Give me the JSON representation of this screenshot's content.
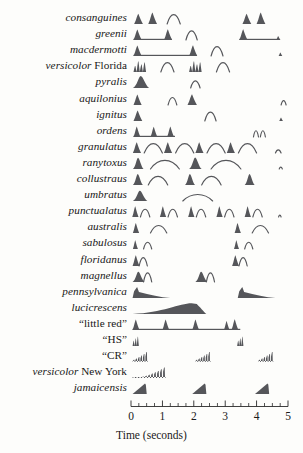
{
  "figure": {
    "axis": {
      "label": "Time (seconds)",
      "ticks": [
        "0",
        "1",
        "2",
        "3",
        "4",
        "5"
      ],
      "min": 0,
      "max": 5,
      "unit": "seconds",
      "x_pixel_start": 131,
      "x_pixel_end": 288
    },
    "colors": {
      "flash_fill": "#55565a",
      "response_stroke": "#55565a",
      "axis": "#2b2b2b",
      "text": "#171717",
      "background": "#fdfdfb"
    },
    "legend_note": "Filled shapes = male flash pattern; thin outline arcs = female response flash"
  },
  "chart_data": {
    "type": "timeline",
    "xlabel": "Time (seconds)",
    "ylabel": "",
    "xlim": [
      0,
      5
    ],
    "grid": false,
    "legend": [
      "male flash (filled)",
      "female response (outline)"
    ],
    "categories": [
      "consanguines",
      "greenii",
      "macdermotti",
      "versicolor Florida",
      "pyralis",
      "aquilonius",
      "ignitus",
      "ordens",
      "granulatus",
      "ranytoxus",
      "collustraus",
      "umbratus",
      "punctualatus",
      "australis",
      "sabulosus",
      "floridanus",
      "magnellus",
      "pennsylvanica",
      "lucicrescens",
      "“little red”",
      "“HS”",
      "“CR”",
      "versicolor New York",
      "jamaicensis"
    ],
    "rows": [
      {
        "species": "consanguines",
        "label_italic": "consanguines",
        "label_roman": "",
        "flashes": [
          {
            "t": 0.1,
            "dur": 0.28,
            "h": 0.78,
            "shape": "peak"
          },
          {
            "t": 0.55,
            "dur": 0.28,
            "h": 0.88,
            "shape": "peak"
          },
          {
            "t": 3.55,
            "dur": 0.28,
            "h": 0.78,
            "shape": "peak"
          },
          {
            "t": 4.0,
            "dur": 0.28,
            "h": 0.88,
            "shape": "peak"
          }
        ],
        "responses": [
          {
            "t": 1.15,
            "dur": 0.42,
            "h": 0.72,
            "shape": "arc"
          }
        ],
        "baselines": []
      },
      {
        "species": "greenii",
        "label_italic": "greenii",
        "label_roman": "",
        "flashes": [
          {
            "t": 0.08,
            "dur": 0.26,
            "h": 0.8,
            "shape": "peak"
          },
          {
            "t": 1.05,
            "dur": 0.26,
            "h": 0.82,
            "shape": "peak"
          },
          {
            "t": 3.45,
            "dur": 0.26,
            "h": 0.82,
            "shape": "peak"
          },
          {
            "t": 4.62,
            "dur": 0.14,
            "h": 0.3,
            "shape": "peak"
          }
        ],
        "responses": [
          {
            "t": 1.75,
            "dur": 0.36,
            "h": 0.7,
            "shape": "arc"
          }
        ],
        "baselines": [
          {
            "t0": 0.08,
            "t1": 1.3
          },
          {
            "t0": 3.45,
            "t1": 4.7
          }
        ]
      },
      {
        "species": "macdermotti",
        "label_italic": "macdermotti",
        "label_roman": "",
        "flashes": [
          {
            "t": 0.08,
            "dur": 0.26,
            "h": 0.8,
            "shape": "peak"
          },
          {
            "t": 1.85,
            "dur": 0.26,
            "h": 0.82,
            "shape": "peak"
          },
          {
            "t": 4.7,
            "dur": 0.12,
            "h": 0.26,
            "shape": "peak"
          }
        ],
        "responses": [
          {
            "t": 2.55,
            "dur": 0.38,
            "h": 0.72,
            "shape": "arc"
          }
        ],
        "baselines": [
          {
            "t0": 0.08,
            "t1": 2.1
          }
        ]
      },
      {
        "species": "versicolor Florida",
        "label_italic": "versicolor",
        "label_roman": " Florida",
        "flashes": [
          {
            "t": 0.08,
            "dur": 0.4,
            "h": 0.8,
            "shape": "comb4"
          },
          {
            "t": 1.85,
            "dur": 0.4,
            "h": 0.8,
            "shape": "comb4"
          }
        ],
        "responses": [
          {
            "t": 0.95,
            "dur": 0.42,
            "h": 0.72,
            "shape": "arc"
          },
          {
            "t": 2.72,
            "dur": 0.42,
            "h": 0.72,
            "shape": "arc"
          }
        ],
        "baselines": []
      },
      {
        "species": "pyralis",
        "label_italic": "pyralis",
        "label_roman": "",
        "flashes": [
          {
            "t": 0.06,
            "dur": 0.52,
            "h": 0.92,
            "shape": "bell"
          }
        ],
        "responses": [
          {
            "t": 1.9,
            "dur": 0.3,
            "h": 0.55,
            "shape": "arc"
          }
        ],
        "baselines": []
      },
      {
        "species": "aquilonius",
        "label_italic": "aquilonius",
        "label_roman": "",
        "flashes": [
          {
            "t": 0.08,
            "dur": 0.26,
            "h": 0.8,
            "shape": "peak"
          },
          {
            "t": 1.8,
            "dur": 0.3,
            "h": 0.82,
            "shape": "peak"
          }
        ],
        "responses": [
          {
            "t": 1.18,
            "dur": 0.28,
            "h": 0.58,
            "shape": "arc"
          },
          {
            "t": 4.78,
            "dur": 0.16,
            "h": 0.34,
            "shape": "arc"
          }
        ],
        "baselines": []
      },
      {
        "species": "ignitus",
        "label_italic": "ignitus",
        "label_roman": "",
        "flashes": [
          {
            "t": 0.08,
            "dur": 0.28,
            "h": 0.8,
            "shape": "peak"
          },
          {
            "t": 4.72,
            "dur": 0.12,
            "h": 0.26,
            "shape": "peak"
          }
        ],
        "responses": [
          {
            "t": 2.35,
            "dur": 0.36,
            "h": 0.68,
            "shape": "arc"
          }
        ],
        "baselines": []
      },
      {
        "species": "ordens",
        "label_italic": "ordens",
        "label_roman": "",
        "flashes": [
          {
            "t": 0.08,
            "dur": 0.22,
            "h": 0.8,
            "shape": "peak"
          },
          {
            "t": 0.62,
            "dur": 0.22,
            "h": 0.78,
            "shape": "peak"
          },
          {
            "t": 1.15,
            "dur": 0.22,
            "h": 0.8,
            "shape": "peak"
          }
        ],
        "responses": [
          {
            "t": 3.9,
            "dur": 0.16,
            "h": 0.48,
            "shape": "arc"
          },
          {
            "t": 4.12,
            "dur": 0.16,
            "h": 0.48,
            "shape": "arc"
          }
        ],
        "baselines": [
          {
            "t0": 0.08,
            "t1": 1.4
          }
        ]
      },
      {
        "species": "granulatus",
        "label_italic": "granulatus",
        "label_roman": "",
        "flashes": [
          {
            "t": 0.06,
            "dur": 0.26,
            "h": 0.82,
            "shape": "peak"
          },
          {
            "t": 1.05,
            "dur": 0.26,
            "h": 0.82,
            "shape": "peak"
          },
          {
            "t": 2.05,
            "dur": 0.26,
            "h": 0.82,
            "shape": "peak"
          },
          {
            "t": 3.05,
            "dur": 0.26,
            "h": 0.82,
            "shape": "peak"
          }
        ],
        "responses": [
          {
            "t": 0.42,
            "dur": 0.58,
            "h": 0.72,
            "shape": "arc"
          },
          {
            "t": 1.42,
            "dur": 0.58,
            "h": 0.72,
            "shape": "arc"
          },
          {
            "t": 2.42,
            "dur": 0.58,
            "h": 0.72,
            "shape": "arc"
          },
          {
            "t": 3.42,
            "dur": 0.58,
            "h": 0.72,
            "shape": "arc"
          },
          {
            "t": 4.6,
            "dur": 0.18,
            "h": 0.24,
            "shape": "arc"
          }
        ],
        "baselines": []
      },
      {
        "species": "ranytoxus",
        "label_italic": "ranytoxus",
        "label_roman": "",
        "flashes": [
          {
            "t": 0.06,
            "dur": 0.34,
            "h": 0.86,
            "shape": "bell"
          },
          {
            "t": 1.85,
            "dur": 0.4,
            "h": 0.88,
            "shape": "bell"
          }
        ],
        "responses": [
          {
            "t": 0.62,
            "dur": 0.92,
            "h": 0.66,
            "shape": "arc"
          },
          {
            "t": 2.55,
            "dur": 0.95,
            "h": 0.66,
            "shape": "arc"
          },
          {
            "t": 4.72,
            "dur": 0.1,
            "h": 0.14,
            "shape": "arc"
          }
        ],
        "baselines": []
      },
      {
        "species": "collustraus",
        "label_italic": "collustraus",
        "label_roman": "",
        "flashes": [
          {
            "t": 0.06,
            "dur": 0.32,
            "h": 0.84,
            "shape": "bell"
          },
          {
            "t": 1.72,
            "dur": 0.32,
            "h": 0.84,
            "shape": "bell"
          },
          {
            "t": 3.62,
            "dur": 0.32,
            "h": 0.84,
            "shape": "bell"
          }
        ],
        "responses": [
          {
            "t": 0.55,
            "dur": 0.62,
            "h": 0.66,
            "shape": "arc"
          },
          {
            "t": 2.25,
            "dur": 0.62,
            "h": 0.66,
            "shape": "arc"
          }
        ],
        "baselines": []
      },
      {
        "species": "umbratus",
        "label_italic": "umbratus",
        "label_roman": "",
        "flashes": [
          {
            "t": 0.06,
            "dur": 0.46,
            "h": 0.78,
            "shape": "bell"
          }
        ],
        "responses": [
          {
            "t": 1.65,
            "dur": 0.95,
            "h": 0.5,
            "shape": "arc"
          }
        ],
        "baselines": []
      },
      {
        "species": "punctualatus",
        "label_italic": "punctualatus",
        "label_roman": "",
        "flashes": [
          {
            "t": 0.04,
            "dur": 0.2,
            "h": 0.82,
            "shape": "peak"
          },
          {
            "t": 0.92,
            "dur": 0.2,
            "h": 0.82,
            "shape": "peak"
          },
          {
            "t": 1.82,
            "dur": 0.2,
            "h": 0.82,
            "shape": "peak"
          },
          {
            "t": 2.72,
            "dur": 0.2,
            "h": 0.82,
            "shape": "peak"
          },
          {
            "t": 3.62,
            "dur": 0.2,
            "h": 0.82,
            "shape": "peak"
          }
        ],
        "responses": [
          {
            "t": 0.3,
            "dur": 0.3,
            "h": 0.6,
            "shape": "arc"
          },
          {
            "t": 1.18,
            "dur": 0.3,
            "h": 0.6,
            "shape": "arc"
          },
          {
            "t": 2.08,
            "dur": 0.3,
            "h": 0.6,
            "shape": "arc"
          },
          {
            "t": 2.98,
            "dur": 0.3,
            "h": 0.6,
            "shape": "arc"
          },
          {
            "t": 3.88,
            "dur": 0.3,
            "h": 0.6,
            "shape": "arc"
          },
          {
            "t": 4.7,
            "dur": 0.08,
            "h": 0.14,
            "shape": "arc"
          }
        ],
        "baselines": []
      },
      {
        "species": "australis",
        "label_italic": "australis",
        "label_roman": "",
        "flashes": [
          {
            "t": 0.06,
            "dur": 0.2,
            "h": 0.76,
            "shape": "peak"
          },
          {
            "t": 3.3,
            "dur": 0.2,
            "h": 0.76,
            "shape": "peak"
          }
        ],
        "responses": [
          {
            "t": 0.62,
            "dur": 0.52,
            "h": 0.58,
            "shape": "arc"
          },
          {
            "t": 3.86,
            "dur": 0.52,
            "h": 0.58,
            "shape": "arc"
          }
        ],
        "baselines": []
      },
      {
        "species": "sabulosus",
        "label_italic": "sabulosus",
        "label_roman": "",
        "flashes": [
          {
            "t": 0.06,
            "dur": 0.16,
            "h": 0.68,
            "shape": "peak"
          },
          {
            "t": 3.28,
            "dur": 0.16,
            "h": 0.68,
            "shape": "peak"
          }
        ],
        "responses": [
          {
            "t": 0.4,
            "dur": 0.26,
            "h": 0.52,
            "shape": "arc"
          },
          {
            "t": 3.62,
            "dur": 0.26,
            "h": 0.52,
            "shape": "arc"
          }
        ],
        "baselines": []
      },
      {
        "species": "floridanus",
        "label_italic": "floridanus",
        "label_roman": "",
        "flashes": [
          {
            "t": 0.05,
            "dur": 0.22,
            "h": 0.82,
            "shape": "peak"
          },
          {
            "t": 3.22,
            "dur": 0.22,
            "h": 0.82,
            "shape": "peak"
          }
        ],
        "responses": [
          {
            "t": 0.26,
            "dur": 0.26,
            "h": 0.64,
            "shape": "arc"
          },
          {
            "t": 3.44,
            "dur": 0.26,
            "h": 0.64,
            "shape": "arc"
          }
        ],
        "baselines": []
      },
      {
        "species": "magnellus",
        "label_italic": "magnellus",
        "label_roman": "",
        "flashes": [
          {
            "t": 0.05,
            "dur": 0.38,
            "h": 0.78,
            "shape": "bell"
          },
          {
            "t": 2.05,
            "dur": 0.38,
            "h": 0.78,
            "shape": "bell"
          }
        ],
        "responses": [
          {
            "t": 0.4,
            "dur": 0.26,
            "h": 0.7,
            "shape": "arc"
          },
          {
            "t": 2.4,
            "dur": 0.26,
            "h": 0.7,
            "shape": "arc"
          }
        ],
        "baselines": []
      },
      {
        "species": "pennsylvanica",
        "label_italic": "pennsylvanica",
        "label_roman": "",
        "flashes": [
          {
            "t": 0.05,
            "dur": 1.2,
            "h": 0.85,
            "shape": "decay"
          },
          {
            "t": 3.4,
            "dur": 1.2,
            "h": 0.85,
            "shape": "decay"
          }
        ],
        "responses": [],
        "baselines": []
      },
      {
        "species": "lucicrescens",
        "label_italic": "lucicrescens",
        "label_roman": "",
        "flashes": [
          {
            "t": 0.05,
            "dur": 2.35,
            "h": 0.82,
            "shape": "crescendo"
          }
        ],
        "responses": [],
        "baselines": []
      },
      {
        "species": "“little red”",
        "label_italic": "",
        "label_roman": "“little red”",
        "flashes": [
          {
            "t": 0.05,
            "dur": 0.22,
            "h": 0.8,
            "shape": "peak"
          },
          {
            "t": 1.0,
            "dur": 0.22,
            "h": 0.8,
            "shape": "peak"
          },
          {
            "t": 1.95,
            "dur": 0.22,
            "h": 0.8,
            "shape": "peak"
          },
          {
            "t": 2.96,
            "dur": 0.18,
            "h": 0.7,
            "shape": "peak"
          },
          {
            "t": 3.2,
            "dur": 0.22,
            "h": 0.82,
            "shape": "peak"
          }
        ],
        "responses": [],
        "baselines": [
          {
            "t0": 0.05,
            "t1": 3.48
          }
        ]
      },
      {
        "species": "“HS”",
        "label_italic": "",
        "label_roman": "“HS”",
        "flashes": [
          {
            "t": 0.05,
            "dur": 0.2,
            "h": 0.72,
            "shape": "comb3"
          },
          {
            "t": 3.38,
            "dur": 0.2,
            "h": 0.72,
            "shape": "comb3"
          }
        ],
        "responses": [],
        "baselines": []
      },
      {
        "species": "“CR”",
        "label_italic": "",
        "label_roman": "“CR”",
        "flashes": [
          {
            "t": 0.05,
            "dur": 0.48,
            "h": 0.76,
            "shape": "ramp-comb"
          },
          {
            "t": 2.05,
            "dur": 0.48,
            "h": 0.76,
            "shape": "ramp-comb"
          },
          {
            "t": 4.05,
            "dur": 0.48,
            "h": 0.76,
            "shape": "ramp-comb"
          }
        ],
        "responses": [],
        "baselines": []
      },
      {
        "species": "versicolor New York",
        "label_italic": "versicolor",
        "label_roman": " New York",
        "flashes": [
          {
            "t": 0.05,
            "dur": 1.05,
            "h": 0.8,
            "shape": "ramp-comb-long"
          }
        ],
        "responses": [],
        "baselines": []
      },
      {
        "species": "jamaicensis",
        "label_italic": "jamaicensis",
        "label_roman": "",
        "flashes": [
          {
            "t": 0.05,
            "dur": 0.45,
            "h": 0.8,
            "shape": "rampup"
          },
          {
            "t": 1.95,
            "dur": 0.45,
            "h": 0.8,
            "shape": "rampup"
          },
          {
            "t": 3.95,
            "dur": 0.45,
            "h": 0.8,
            "shape": "rampup"
          }
        ],
        "responses": [],
        "baselines": []
      }
    ]
  }
}
